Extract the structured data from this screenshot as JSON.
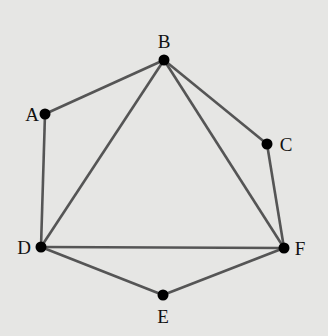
{
  "diagram": {
    "type": "graph",
    "background": "#e6e6e4",
    "edge_color": "#555555",
    "node_color": "#000000",
    "nodes": [
      {
        "id": "A",
        "label": "A",
        "x": 45,
        "y": 114,
        "lx": 32,
        "ly": 121
      },
      {
        "id": "B",
        "label": "B",
        "x": 164,
        "y": 60,
        "lx": 164,
        "ly": 48
      },
      {
        "id": "C",
        "label": "C",
        "x": 267,
        "y": 144,
        "lx": 286,
        "ly": 151
      },
      {
        "id": "D",
        "label": "D",
        "x": 41,
        "y": 247,
        "lx": 24,
        "ly": 254
      },
      {
        "id": "E",
        "label": "E",
        "x": 163,
        "y": 295,
        "lx": 163,
        "ly": 323
      },
      {
        "id": "F",
        "label": "F",
        "x": 284,
        "y": 248,
        "lx": 300,
        "ly": 255
      }
    ],
    "edges": [
      [
        "A",
        "B"
      ],
      [
        "A",
        "D"
      ],
      [
        "B",
        "C"
      ],
      [
        "B",
        "D"
      ],
      [
        "B",
        "F"
      ],
      [
        "C",
        "F"
      ],
      [
        "D",
        "F"
      ],
      [
        "D",
        "E"
      ],
      [
        "E",
        "F"
      ]
    ]
  }
}
